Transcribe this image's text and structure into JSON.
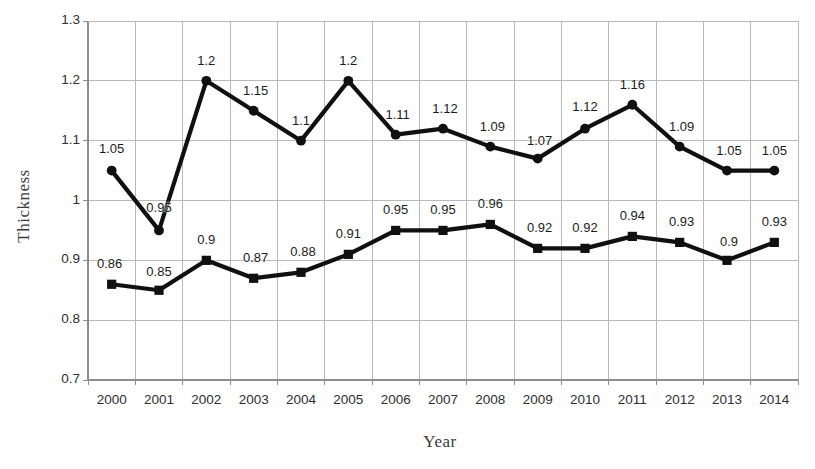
{
  "chart_data": {
    "type": "line",
    "title": "",
    "xlabel": "Year",
    "ylabel": "Thickness",
    "categories": [
      "2000",
      "2001",
      "2002",
      "2003",
      "2004",
      "2005",
      "2006",
      "2007",
      "2008",
      "2009",
      "2010",
      "2011",
      "2012",
      "2013",
      "2014"
    ],
    "ylim": [
      0.7,
      1.3
    ],
    "yticks": [
      "0.7",
      "0.8",
      "0.9",
      "1",
      "1.1",
      "1.2",
      "1.3"
    ],
    "ytick_values": [
      0.7,
      0.8,
      0.9,
      1.0,
      1.1,
      1.2,
      1.3
    ],
    "grid": true,
    "legend": "none",
    "series": [
      {
        "name": "upper-series",
        "marker": "circle",
        "color": "#000000",
        "values": [
          1.05,
          0.95,
          1.2,
          1.15,
          1.1,
          1.2,
          1.11,
          1.12,
          1.09,
          1.07,
          1.12,
          1.16,
          1.09,
          1.05,
          1.05
        ],
        "labels": [
          "1.05",
          "0.95",
          "1.2",
          "1.15",
          "1.1",
          "1.2",
          "1.11",
          "1.12",
          "1.09",
          "1.07",
          "1.12",
          "1.16",
          "1.09",
          "1.05",
          "1.05"
        ]
      },
      {
        "name": "lower-series",
        "marker": "square",
        "color": "#000000",
        "values": [
          0.86,
          0.85,
          0.9,
          0.87,
          0.88,
          0.91,
          0.95,
          0.95,
          0.96,
          0.92,
          0.92,
          0.94,
          0.93,
          0.9,
          0.93
        ],
        "labels": [
          "0.86",
          "0.85",
          "0.9",
          "0.87",
          "0.88",
          "0.91",
          "0.95",
          "0.95",
          "0.96",
          "0.92",
          "0.92",
          "0.94",
          "0.93",
          "0.9",
          "0.93"
        ]
      }
    ],
    "label_offsets": {
      "upper": [
        {
          "dx": 0,
          "dy": -30
        },
        {
          "dx": 0,
          "dy": -30
        },
        {
          "dx": 0,
          "dy": -28
        },
        {
          "dx": 2,
          "dy": -28
        },
        {
          "dx": 0,
          "dy": -28
        },
        {
          "dx": 0,
          "dy": -28
        },
        {
          "dx": 2,
          "dy": -28
        },
        {
          "dx": 2,
          "dy": -28
        },
        {
          "dx": 2,
          "dy": -28
        },
        {
          "dx": 2,
          "dy": -26
        },
        {
          "dx": 0,
          "dy": -30
        },
        {
          "dx": 0,
          "dy": -28
        },
        {
          "dx": 2,
          "dy": -28
        },
        {
          "dx": 2,
          "dy": -28
        },
        {
          "dx": 0,
          "dy": -28
        }
      ],
      "lower": [
        {
          "dx": -2,
          "dy": -28
        },
        {
          "dx": 0,
          "dy": -26
        },
        {
          "dx": 0,
          "dy": -28
        },
        {
          "dx": 2,
          "dy": -28
        },
        {
          "dx": 2,
          "dy": -28
        },
        {
          "dx": 0,
          "dy": -28
        },
        {
          "dx": 0,
          "dy": -28
        },
        {
          "dx": 0,
          "dy": -28
        },
        {
          "dx": 0,
          "dy": -28
        },
        {
          "dx": 2,
          "dy": -28
        },
        {
          "dx": 0,
          "dy": -28
        },
        {
          "dx": 0,
          "dy": -28
        },
        {
          "dx": 2,
          "dy": -28
        },
        {
          "dx": 2,
          "dy": -26
        },
        {
          "dx": 0,
          "dy": -28
        }
      ]
    },
    "colors": {
      "line": "#101010",
      "grid": "#b9b9b9",
      "axis": "#8d8d8d",
      "text": "#2f2f2f",
      "background": "#fefefe"
    }
  }
}
